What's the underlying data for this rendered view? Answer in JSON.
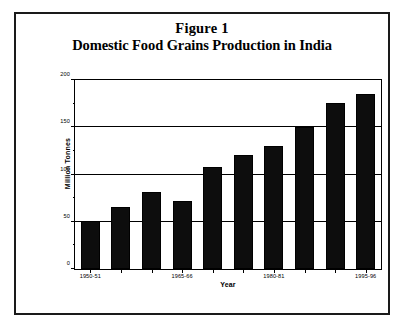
{
  "figure": {
    "title_line1": "Figure 1",
    "title_line2": "Domestic Food Grains Production in India",
    "border_color": "#1a1a1a",
    "background": "#ffffff"
  },
  "chart_data": {
    "type": "bar",
    "title": "Domestic Food Grains Production in India",
    "subtitle": "Figure 1",
    "xlabel": "Year",
    "ylabel": "Million Tonnes",
    "ylim": [
      0,
      200
    ],
    "yticks": [
      0,
      50,
      100,
      150,
      200
    ],
    "ytick_labels": [
      "0",
      "50",
      "100",
      "150",
      "200"
    ],
    "yticks_minor": [
      25,
      75,
      125,
      175
    ],
    "grid": true,
    "grid_axis": "y",
    "legend": false,
    "bar_color": "#0d0d0d",
    "categories": [
      "1950-51",
      "1955-56",
      "1960-61",
      "1965-66",
      "1970-71",
      "1975-76",
      "1980-81",
      "1985-86",
      "1990-91",
      "1995-96"
    ],
    "xtick_labeled": [
      "1950-51",
      "1965-66",
      "1980-81",
      "1995-96"
    ],
    "xtick_labeled_index": [
      0,
      3,
      6,
      9
    ],
    "values": [
      51,
      66,
      82,
      72,
      108,
      121,
      130,
      150,
      176,
      185
    ],
    "units": "Million Tonnes"
  }
}
